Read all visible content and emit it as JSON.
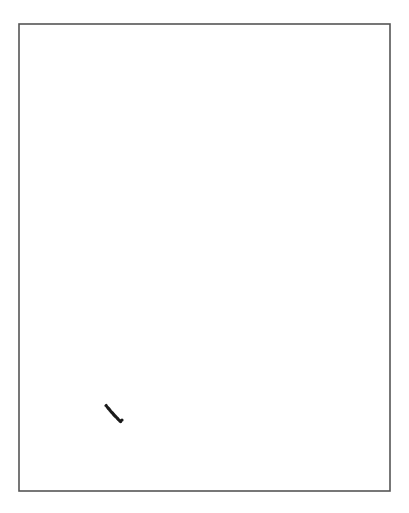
{
  "figure": {
    "background_color": "#ffffff",
    "frame": {
      "x": 19,
      "y": 24,
      "width": 371,
      "height": 467,
      "stroke_color": "#555555",
      "stroke_width": 1.6
    },
    "ellipse": {
      "cx": 201.5,
      "cy": 250.5,
      "rx": 144.5,
      "ry": 206.5,
      "stroke_color": "#1a1a1a",
      "stroke_width": 2,
      "gap": {
        "start": {
          "x": 101,
          "y": 413
        },
        "end": {
          "x": 122,
          "y": 420
        }
      }
    }
  }
}
